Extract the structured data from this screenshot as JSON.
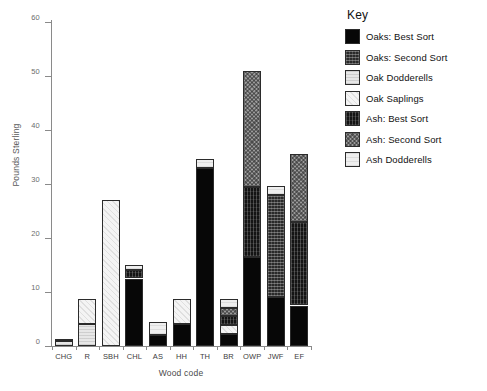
{
  "chart_data": {
    "type": "bar",
    "subtype": "stacked",
    "title": "",
    "xlabel": "Wood code",
    "ylabel": "Pounds Sterling",
    "ylim": [
      0,
      60
    ],
    "yticks": [
      0,
      10,
      20,
      30,
      40,
      50,
      60
    ],
    "grid": false,
    "legend_position": "right",
    "legend_title": "Key",
    "categories": [
      "CHG",
      "R",
      "SBH",
      "CHL",
      "AS",
      "HH",
      "TH",
      "BR",
      "OWP",
      "JWF",
      "EF"
    ],
    "series": [
      {
        "name": "Oaks: Best Sort",
        "key": "oaks-best",
        "values": [
          0,
          0,
          0,
          12.5,
          2.0,
          4.0,
          33.0,
          2.2,
          16.5,
          9.0,
          7.5
        ]
      },
      {
        "name": "Oaks: Second Sort",
        "key": "oaks-second",
        "values": [
          0,
          0,
          0,
          0,
          0,
          0,
          0,
          0,
          0,
          19.0,
          0
        ]
      },
      {
        "name": "Oak Dodderells",
        "key": "oak-dodd",
        "values": [
          1.0,
          4.0,
          0,
          0,
          0,
          0,
          0,
          0,
          0,
          0,
          0
        ]
      },
      {
        "name": "Oak Saplings",
        "key": "oak-sap",
        "values": [
          0,
          4.7,
          27.0,
          0,
          0,
          4.7,
          0,
          1.6,
          0,
          0,
          0
        ]
      },
      {
        "name": "Ash: Best Sort",
        "key": "ash-best",
        "values": [
          0,
          0,
          0,
          1.6,
          0,
          0,
          0,
          1.7,
          13.0,
          0,
          15.5
        ]
      },
      {
        "name": "Ash: Second Sort",
        "key": "ash-second",
        "values": [
          0,
          0,
          0,
          0,
          0,
          0,
          0,
          1.5,
          21.5,
          0,
          12.5
        ]
      },
      {
        "name": "Ash Dodderells",
        "key": "ash-dodd",
        "values": [
          0.3,
          0,
          0,
          0.9,
          2.5,
          0,
          1.7,
          1.7,
          0,
          1.7,
          0
        ]
      }
    ],
    "totals": [
      1.3,
      8.7,
      27.0,
      15.0,
      4.5,
      8.7,
      34.7,
      8.7,
      51.0,
      29.7,
      35.5
    ]
  },
  "legend": {
    "title": "Key",
    "entries": [
      {
        "label": "Oaks: Best Sort",
        "key": "oaks-best"
      },
      {
        "label": "Oaks: Second Sort",
        "key": "oaks-second"
      },
      {
        "label": "Oak Dodderells",
        "key": "oak-dodd"
      },
      {
        "label": "Oak Saplings",
        "key": "oak-sap"
      },
      {
        "label": "Ash: Best Sort",
        "key": "ash-best"
      },
      {
        "label": "Ash: Second Sort",
        "key": "ash-second"
      },
      {
        "label": "Ash Dodderells",
        "key": "ash-dodd"
      }
    ]
  },
  "axes": {
    "y_label": "Pounds Sterling",
    "x_label": "Wood code",
    "y_tick_labels": [
      "0",
      "10",
      "20",
      "30",
      "40",
      "50",
      "60"
    ],
    "x_tick_labels": [
      "CHG",
      "R",
      "SBH",
      "CHL",
      "AS",
      "HH",
      "TH",
      "BR",
      "OWP",
      "JWF",
      "EF"
    ]
  }
}
